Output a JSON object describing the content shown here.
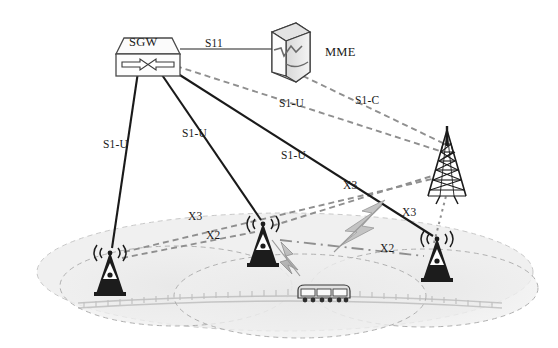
{
  "figure": {
    "type": "network-architecture-diagram",
    "background_color": "#ffffff"
  },
  "colors": {
    "solid_link": "#1a1a1a",
    "gray_link": "#8c8c8c",
    "dashed_link": "#8c8c8c",
    "coverage_fill": "#ececec",
    "coverage_stroke": "#b5b5b5",
    "node_fill": "#f2f2f2",
    "node_stroke": "#4d4d4d",
    "interference": "#b0b0b0",
    "text": "#1a1a1a"
  },
  "nodes": [
    {
      "id": "sgw",
      "name": "sgw-node",
      "label": "SGW",
      "type": "router",
      "x": 148,
      "y": 52
    },
    {
      "id": "mme",
      "name": "mme-node",
      "label": "MME",
      "type": "server",
      "x": 290,
      "y": 52
    },
    {
      "id": "macro",
      "name": "macro-tower",
      "label": "",
      "type": "lattice-tower",
      "x": 447,
      "y": 168
    },
    {
      "id": "enb_left",
      "name": "enodeb-left",
      "label": "",
      "type": "base-station",
      "x": 110,
      "y": 272
    },
    {
      "id": "enb_mid",
      "name": "enodeb-middle",
      "label": "",
      "type": "base-station",
      "x": 263,
      "y": 243
    },
    {
      "id": "enb_right",
      "name": "enodeb-right",
      "label": "",
      "type": "base-station",
      "x": 437,
      "y": 258
    },
    {
      "id": "train",
      "name": "train-vehicle",
      "label": "",
      "type": "train",
      "x": 323,
      "y": 296
    }
  ],
  "link_labels": [
    {
      "id": "s11",
      "text": "S11",
      "x": 208,
      "y": 44,
      "name": "link-label-s11"
    },
    {
      "id": "s1u_1",
      "text": "S1-U",
      "x": 105,
      "y": 144,
      "name": "link-label-s1u-left"
    },
    {
      "id": "s1u_2",
      "text": "S1-U",
      "x": 185,
      "y": 133,
      "name": "link-label-s1u-middle"
    },
    {
      "id": "s1u_3",
      "text": "S1-U",
      "x": 283,
      "y": 155,
      "name": "link-label-s1u-right"
    },
    {
      "id": "s1u_4",
      "text": "S1-U",
      "x": 281,
      "y": 103,
      "name": "link-label-s1u-dashed"
    },
    {
      "id": "s1c",
      "text": "S1-C",
      "x": 357,
      "y": 100,
      "name": "link-label-s1c"
    },
    {
      "id": "x3_a",
      "text": "X3",
      "x": 190,
      "y": 216,
      "name": "link-label-x3-left"
    },
    {
      "id": "x2_a",
      "text": "X2",
      "x": 208,
      "y": 235,
      "name": "link-label-x2-left"
    },
    {
      "id": "x3_b",
      "text": "X3",
      "x": 345,
      "y": 185,
      "name": "link-label-x3-middle"
    },
    {
      "id": "x2_b",
      "text": "X2",
      "x": 382,
      "y": 248,
      "name": "link-label-x2-right"
    },
    {
      "id": "x3_c",
      "text": "X3",
      "x": 404,
      "y": 212,
      "name": "link-label-x3-right"
    },
    {
      "id": "mme_lbl",
      "text": "MME",
      "x": 326,
      "y": 52,
      "name": "node-label-mme"
    }
  ],
  "links": [
    {
      "id": "sgw_mme",
      "label": "S11",
      "style": "solid-gray",
      "from": "sgw",
      "to": "mme"
    },
    {
      "id": "sgw_enb_l",
      "label": "S1-U",
      "style": "solid-black",
      "from": "sgw",
      "to": "enb_left"
    },
    {
      "id": "sgw_enb_m",
      "label": "S1-U",
      "style": "solid-black",
      "from": "sgw",
      "to": "enb_mid"
    },
    {
      "id": "sgw_enb_r",
      "label": "S1-U",
      "style": "solid-black",
      "from": "sgw",
      "to": "enb_right"
    },
    {
      "id": "sgw_macro",
      "label": "S1-U",
      "style": "dashed-gray",
      "from": "sgw",
      "to": "macro"
    },
    {
      "id": "mme_macro",
      "label": "S1-C",
      "style": "dashed-gray",
      "from": "mme",
      "to": "macro"
    },
    {
      "id": "x2_l_m",
      "label": "X2",
      "style": "dashed-gray",
      "from": "enb_left",
      "to": "enb_mid"
    },
    {
      "id": "x3_l_macro",
      "label": "X3",
      "style": "dashed-gray",
      "from": "enb_left",
      "to": "macro"
    },
    {
      "id": "x3_m_macro",
      "label": "X3",
      "style": "dashed-gray",
      "from": "enb_mid",
      "to": "macro"
    },
    {
      "id": "x2_m_r",
      "label": "X2",
      "style": "dashdot-gray",
      "from": "enb_mid",
      "to": "enb_right"
    },
    {
      "id": "x3_r_macro",
      "label": "X3",
      "style": "dotted-gray",
      "from": "enb_right",
      "to": "macro"
    }
  ],
  "coverage_areas": [
    {
      "id": "cell_left",
      "name": "coverage-area-left",
      "cx": 175,
      "cy": 285,
      "rx": 115,
      "ry": 40
    },
    {
      "id": "cell_middle",
      "name": "coverage-area-middle",
      "cx": 300,
      "cy": 295,
      "rx": 125,
      "ry": 42
    },
    {
      "id": "cell_right",
      "name": "coverage-area-right",
      "cx": 425,
      "cy": 288,
      "rx": 115,
      "ry": 40
    },
    {
      "id": "cell_macro",
      "name": "coverage-area-macro",
      "cx": 285,
      "cy": 270,
      "rx": 245,
      "ry": 58
    }
  ],
  "interference": [
    {
      "id": "bolt_mid",
      "name": "interference-bolt-middle",
      "x": 288,
      "y": 258
    },
    {
      "id": "bolt_right",
      "name": "interference-bolt-right",
      "x": 358,
      "y": 228
    }
  ],
  "railway": {
    "name": "railway-track",
    "cx": 290,
    "cy": 303,
    "rx": 215,
    "ry": 12
  }
}
